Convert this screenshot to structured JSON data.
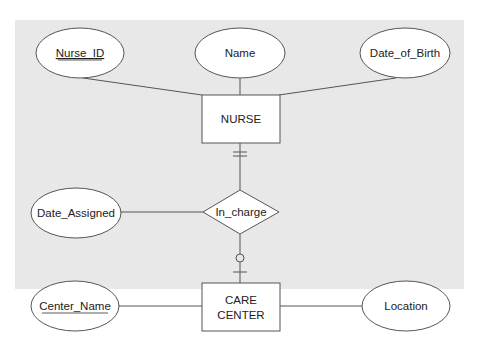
{
  "diagram": {
    "type": "ER diagram",
    "background_color": "#e8e8e8",
    "entities": [
      {
        "id": "nurse",
        "label": "NURSE"
      },
      {
        "id": "care_center",
        "label_line1": "CARE",
        "label_line2": "CENTER"
      }
    ],
    "relationship": {
      "id": "in_charge",
      "label": "In_charge"
    },
    "attributes": [
      {
        "id": "nurse_id",
        "label": "Nurse_ID",
        "key": true
      },
      {
        "id": "name",
        "label": "Name",
        "key": false
      },
      {
        "id": "date_of_birth",
        "label": "Date_of_Birth",
        "key": false
      },
      {
        "id": "date_assigned",
        "label": "Date_Assigned",
        "key": false
      },
      {
        "id": "center_name",
        "label": "Center_Name",
        "key": true
      },
      {
        "id": "location",
        "label": "Location",
        "key": false
      }
    ],
    "cardinalities": {
      "nurse_side": "mandatory one",
      "care_center_side": "optional one"
    }
  }
}
